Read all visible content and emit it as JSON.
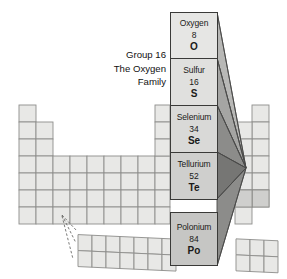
{
  "figure": {
    "caption_lines": [
      "Group 16",
      "The Oxygen",
      "Family"
    ],
    "accent_color": "#8c8c8a",
    "cell_fill": "#e8e8e6",
    "cell_stroke": "#8e8e8c"
  },
  "group_column": {
    "elements": [
      {
        "name": "Oxygen",
        "number": "8",
        "symbol": "O"
      },
      {
        "name": "Sulfur",
        "number": "16",
        "symbol": "S"
      },
      {
        "name": "Selenium",
        "number": "34",
        "symbol": "Se"
      },
      {
        "name": "Tellurium",
        "number": "52",
        "symbol": "Te"
      },
      {
        "name": "Polonium",
        "number": "84",
        "symbol": "Po"
      }
    ]
  }
}
